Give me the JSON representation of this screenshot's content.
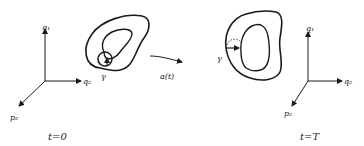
{
  "figure": {
    "type": "phase-space-flow-diagram",
    "left_panel": {
      "time_label": "t=0",
      "axes": {
        "vertical": "q1",
        "horizontal": "q2",
        "diagonal": "p2"
      },
      "vertical_label": "q₁",
      "horizontal_label": "q₂",
      "diagonal_label": "p₂",
      "curve_label": "γ"
    },
    "flow_arrow": {
      "label": "a(t)"
    },
    "right_panel": {
      "time_label": "t=T",
      "axes": {
        "vertical": "q1",
        "horizontal": "q2",
        "diagonal": "p2"
      },
      "vertical_label": "q₁",
      "horizontal_label": "q₂",
      "diagonal_label": "p₂",
      "curve_label": "γ"
    },
    "colors": {
      "ink": "#1a1a1a",
      "background": "#ffffff"
    }
  }
}
